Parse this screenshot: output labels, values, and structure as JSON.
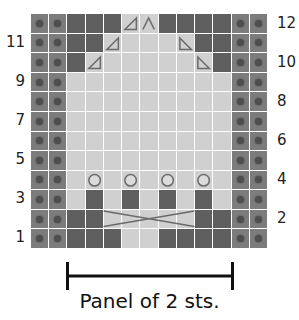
{
  "chart_data": {
    "type": "table",
    "caption": "Panel of 2 sts.",
    "columns": 13,
    "rows": 12,
    "border_columns": {
      "left": [
        0,
        1
      ],
      "right": [
        11,
        12
      ],
      "symbol": "bobble-dot"
    },
    "row_labels_left": [
      "11",
      "9",
      "7",
      "5",
      "3",
      "1"
    ],
    "row_labels_right": [
      "12",
      "10",
      "8",
      "6",
      "4",
      "2"
    ],
    "inner_rows_top_to_bottom": [
      {
        "row": 12,
        "cells": [
          "dark",
          "dark",
          "dark",
          "tri-left",
          "decrease",
          "dark",
          "dark",
          "dark",
          "dark"
        ]
      },
      {
        "row": 11,
        "cells": [
          "dark",
          "dark",
          "tri-left",
          "light",
          "light",
          "light",
          "tri-right",
          "dark",
          "dark"
        ]
      },
      {
        "row": 10,
        "cells": [
          "dark",
          "tri-left",
          "light",
          "light",
          "light",
          "light",
          "light",
          "tri-right",
          "dark"
        ]
      },
      {
        "row": 9,
        "cells": [
          "light",
          "light",
          "light",
          "light",
          "light",
          "light",
          "light",
          "light",
          "light"
        ]
      },
      {
        "row": 8,
        "cells": [
          "light",
          "light",
          "light",
          "light",
          "light",
          "light",
          "light",
          "light",
          "light"
        ]
      },
      {
        "row": 7,
        "cells": [
          "light",
          "light",
          "light",
          "light",
          "light",
          "light",
          "light",
          "light",
          "light"
        ]
      },
      {
        "row": 6,
        "cells": [
          "light",
          "light",
          "light",
          "light",
          "light",
          "light",
          "light",
          "light",
          "light"
        ]
      },
      {
        "row": 5,
        "cells": [
          "light",
          "light",
          "light",
          "light",
          "light",
          "light",
          "light",
          "light",
          "light"
        ]
      },
      {
        "row": 4,
        "cells": [
          "light",
          "circle",
          "light",
          "circle",
          "light",
          "circle",
          "light",
          "circle",
          "light"
        ]
      },
      {
        "row": 3,
        "cells": [
          "light",
          "dark",
          "light",
          "dark",
          "light",
          "dark",
          "light",
          "dark",
          "light"
        ]
      },
      {
        "row": 2,
        "cells": [
          "dark",
          "dark",
          "cable",
          "cable",
          "cable",
          "cable",
          "cable",
          "dark",
          "dark"
        ]
      },
      {
        "row": 1,
        "cells": [
          "dark",
          "dark",
          "dark",
          "light",
          "light",
          "dark",
          "dark",
          "dark",
          "dark"
        ]
      }
    ],
    "colors": {
      "border": "#7c7c7c",
      "dark": "#5f5f5f",
      "light": "#d0d0d0",
      "symbol": "#6a6a6a",
      "grid_line": "#ffffff"
    }
  },
  "labels": {
    "left": [
      "11",
      "9",
      "7",
      "5",
      "3",
      "1"
    ],
    "right": [
      "12",
      "10",
      "8",
      "6",
      "4",
      "2"
    ]
  },
  "caption": "Panel of 2 sts."
}
